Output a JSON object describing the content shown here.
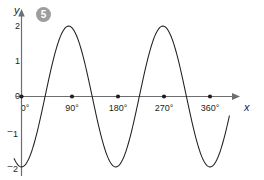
{
  "figure": {
    "badge_label": "5",
    "badge_color": "#9d9d9d",
    "curve_color": "#231f20",
    "axis_color": "#6d6e71"
  },
  "chart_data": {
    "type": "line",
    "title": "",
    "subtitle": "",
    "xlabel": "x",
    "ylabel": "y",
    "xlim": [
      -12,
      400
    ],
    "ylim": [
      -2.35,
      2.4
    ],
    "grid": false,
    "legend": null,
    "x_tick_labels": [
      "0°",
      "90°",
      "180°",
      "270°",
      "360°"
    ],
    "x_ticks": [
      0,
      90,
      180,
      270,
      360
    ],
    "y_tick_labels": [
      "2",
      "1",
      "0",
      "⁻1",
      "⁻2"
    ],
    "y_ticks": [
      2,
      1,
      0,
      -1,
      -2
    ],
    "series": [
      {
        "name": "y = -2 cos(2x)",
        "amplitude": 2,
        "period_degrees": 180,
        "x": [
          0,
          10,
          20,
          30,
          40,
          45,
          50,
          60,
          70,
          80,
          90,
          100,
          110,
          120,
          130,
          135,
          140,
          150,
          160,
          170,
          180,
          190,
          200,
          210,
          220,
          225,
          230,
          240,
          250,
          260,
          270,
          280,
          290,
          300,
          310,
          315,
          320,
          330,
          340,
          350,
          360,
          370,
          380,
          390
        ],
        "values": [
          -2,
          -1.88,
          -1.53,
          -1,
          -0.35,
          0,
          0.35,
          1,
          1.53,
          1.88,
          2,
          1.88,
          1.53,
          1,
          0.35,
          0,
          -0.35,
          -1,
          -1.53,
          -1.88,
          -2,
          -1.88,
          -1.53,
          -1,
          -0.35,
          0,
          0.35,
          1,
          1.53,
          1.88,
          2,
          1.88,
          1.53,
          1,
          0.35,
          0,
          -0.35,
          -1,
          -1.53,
          -1.88,
          -2,
          -1.88,
          -1.53,
          -1
        ]
      }
    ],
    "axis_tick_dots_on_x_axis": true
  }
}
